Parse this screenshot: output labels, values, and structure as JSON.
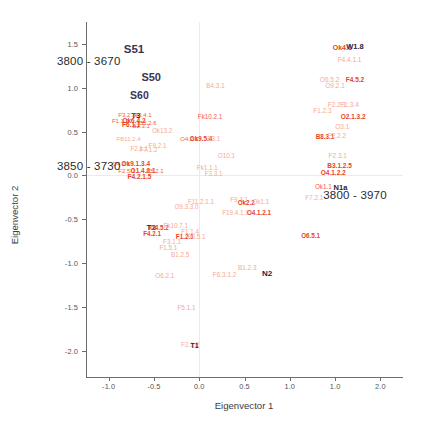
{
  "chart_data": {
    "type": "scatter",
    "title": "",
    "xlabel": "Eigenvector 1",
    "ylabel": "Eigenvector 2",
    "xlim": [
      -1.25,
      2.25
    ],
    "ylim": [
      -2.3,
      1.75
    ],
    "grid": false,
    "legend": null,
    "xticks": [
      "-1.0",
      "-0.5",
      "0.0",
      "0.5",
      "1.0",
      "1.0",
      "2.0"
    ],
    "xtick_values": [
      -1.0,
      -0.5,
      0.0,
      0.5,
      1.0,
      1.5,
      2.0
    ],
    "yticks": [
      "1.5",
      "1.0",
      "0.5",
      "0.0",
      "-0.5",
      "-1.0",
      "-1.5",
      "-2.0"
    ],
    "ytick_values": [
      1.5,
      1.0,
      0.5,
      0.0,
      -0.5,
      -1.0,
      -1.5,
      -2.0
    ],
    "annotations": [
      {
        "text": "3800 - 3670",
        "x": -1.22,
        "y": 1.3,
        "name": "annotation-cluster-left-top"
      },
      {
        "text": "3850 - 3730",
        "x": -1.22,
        "y": 0.11,
        "name": "annotation-cluster-left-bottom"
      },
      {
        "text": "3800 - 3970",
        "x": 1.72,
        "y": -0.22,
        "name": "annotation-cluster-right"
      }
    ],
    "points": [
      {
        "label": "S51",
        "x": -0.72,
        "y": 1.43,
        "style": "navy",
        "size": 11.5
      },
      {
        "label": "S50",
        "x": -0.53,
        "y": 1.12,
        "style": "navy",
        "size": 11
      },
      {
        "label": "S60",
        "x": -0.66,
        "y": 0.92,
        "style": "navy",
        "size": 10.5
      },
      {
        "label": "T3",
        "x": -0.7,
        "y": 0.68,
        "style": "dark",
        "size": 8
      },
      {
        "label": "F3.2.1",
        "x": -0.8,
        "y": 0.685,
        "style": "red",
        "size": 6
      },
      {
        "label": "F3.4.1",
        "x": -0.62,
        "y": 0.685,
        "style": "red",
        "size": 6
      },
      {
        "label": "F1.1.2",
        "x": -0.87,
        "y": 0.615,
        "style": "red",
        "size": 6
      },
      {
        "label": "Ok6.4.2",
        "x": -0.72,
        "y": 0.615,
        "style": "redd",
        "size": 6.5
      },
      {
        "label": "O5.2.6",
        "x": -0.57,
        "y": 0.6,
        "style": "red",
        "size": 6
      },
      {
        "label": "F6.1.1",
        "x": -0.75,
        "y": 0.575,
        "style": "redd",
        "size": 6.5
      },
      {
        "label": "B2.3.1",
        "x": -0.64,
        "y": 0.565,
        "style": "red",
        "size": 6
      },
      {
        "label": "Ok13.2",
        "x": -0.41,
        "y": 0.505,
        "style": "pale",
        "size": 6.3
      },
      {
        "label": "FB11.2.4",
        "x": -0.78,
        "y": 0.415,
        "style": "pale",
        "size": 6
      },
      {
        "label": "F9.2.1",
        "x": -0.46,
        "y": 0.335,
        "style": "pale",
        "size": 6.3
      },
      {
        "label": "F2.1.1",
        "x": -0.66,
        "y": 0.3,
        "style": "pale",
        "size": 6.3
      },
      {
        "label": "F7.1.2",
        "x": -0.56,
        "y": 0.295,
        "style": "pale",
        "size": 6.3
      },
      {
        "label": "O4.2.1",
        "x": -0.86,
        "y": 0.135,
        "style": "red",
        "size": 6
      },
      {
        "label": "Ok9.1.3.4",
        "x": -0.7,
        "y": 0.135,
        "style": "redd",
        "size": 6.5
      },
      {
        "label": "F2.5.1",
        "x": -0.8,
        "y": 0.055,
        "style": "red",
        "size": 6
      },
      {
        "label": "O1.4.2.1",
        "x": -0.62,
        "y": 0.055,
        "style": "redd",
        "size": 6.5
      },
      {
        "label": "B5.2.1",
        "x": -0.49,
        "y": 0.045,
        "style": "red",
        "size": 6
      },
      {
        "label": "F4.2.1.5",
        "x": -0.66,
        "y": -0.02,
        "style": "redd",
        "size": 6.5
      },
      {
        "label": "B4.3.1",
        "x": 0.18,
        "y": 1.02,
        "style": "pale",
        "size": 6.4
      },
      {
        "label": "Fk10.2.1",
        "x": 0.12,
        "y": 0.665,
        "style": "red",
        "size": 6.3
      },
      {
        "label": "O4.2.1",
        "x": -0.11,
        "y": 0.415,
        "style": "red",
        "size": 6
      },
      {
        "label": "Ok9.5.4",
        "x": 0.02,
        "y": 0.415,
        "style": "redd",
        "size": 6.3
      },
      {
        "label": "B3.1",
        "x": 0.16,
        "y": 0.415,
        "style": "pale",
        "size": 6.3
      },
      {
        "label": "O10.1",
        "x": 0.3,
        "y": 0.225,
        "style": "pale",
        "size": 6.4
      },
      {
        "label": "Fk1.1.1",
        "x": 0.09,
        "y": 0.085,
        "style": "pale",
        "size": 6.3
      },
      {
        "label": "F3.3.1",
        "x": 0.16,
        "y": 0.015,
        "style": "pale",
        "size": 6.3
      },
      {
        "label": "Ok4.1",
        "x": 1.58,
        "y": 1.47,
        "style": "redd",
        "size": 7
      },
      {
        "label": "W1.8",
        "x": 1.72,
        "y": 1.47,
        "style": "dark",
        "size": 7.5
      },
      {
        "label": "F4.4.1.1",
        "x": 1.66,
        "y": 1.315,
        "style": "pale",
        "size": 6.5
      },
      {
        "label": "O6.5.2",
        "x": 1.44,
        "y": 1.085,
        "style": "pale",
        "size": 6.5
      },
      {
        "label": "F4.5.2",
        "x": 1.72,
        "y": 1.085,
        "style": "redd",
        "size": 6.5
      },
      {
        "label": "O9.2.1",
        "x": 1.5,
        "y": 1.015,
        "style": "pale",
        "size": 6.5
      },
      {
        "label": "F2.2.1",
        "x": 1.52,
        "y": 0.805,
        "style": "pale",
        "size": 6.5
      },
      {
        "label": "F1.3.4",
        "x": 1.66,
        "y": 0.805,
        "style": "pale",
        "size": 6.5
      },
      {
        "label": "F1.2.3",
        "x": 1.36,
        "y": 0.735,
        "style": "pale",
        "size": 6.5
      },
      {
        "label": "O2.1.3.2",
        "x": 1.7,
        "y": 0.665,
        "style": "redd",
        "size": 6.5
      },
      {
        "label": "O3.1",
        "x": 1.58,
        "y": 0.555,
        "style": "pale",
        "size": 6.5
      },
      {
        "label": "B8.3.1",
        "x": 1.39,
        "y": 0.435,
        "style": "redd",
        "size": 6.3
      },
      {
        "label": "F2.2.2",
        "x": 1.52,
        "y": 0.455,
        "style": "pale",
        "size": 6.5
      },
      {
        "label": "F2.3.1",
        "x": 1.53,
        "y": 0.225,
        "style": "pale",
        "size": 6.5
      },
      {
        "label": "B3.1.2.5",
        "x": 1.55,
        "y": 0.105,
        "style": "redd",
        "size": 6.5
      },
      {
        "label": "O4.1.2.2",
        "x": 1.48,
        "y": 0.025,
        "style": "redd",
        "size": 6.5
      },
      {
        "label": "Ok1.1",
        "x": 1.37,
        "y": -0.135,
        "style": "red",
        "size": 6.3
      },
      {
        "label": "N1a",
        "x": 1.56,
        "y": -0.14,
        "style": "dark",
        "size": 7.5
      },
      {
        "label": "F7.2.1",
        "x": 1.27,
        "y": -0.255,
        "style": "pale",
        "size": 6.3
      },
      {
        "label": "T2",
        "x": -0.53,
        "y": -0.6,
        "style": "dark",
        "size": 8
      },
      {
        "label": "F11.2.1.1",
        "x": 0.02,
        "y": -0.3,
        "style": "pale",
        "size": 6.3
      },
      {
        "label": "O9.3.3.0",
        "x": -0.14,
        "y": -0.355,
        "style": "pale",
        "size": 6.3
      },
      {
        "label": "F9.3.1",
        "x": 0.44,
        "y": -0.285,
        "style": "pale",
        "size": 6.3
      },
      {
        "label": "Ok2.2",
        "x": 0.52,
        "y": -0.31,
        "style": "redd",
        "size": 6.3
      },
      {
        "label": "Ok1.1",
        "x": 0.68,
        "y": -0.305,
        "style": "pale",
        "size": 6.3
      },
      {
        "label": "F19.4.1.1",
        "x": 0.4,
        "y": -0.425,
        "style": "pale",
        "size": 6.3
      },
      {
        "label": "O4.1.2.1",
        "x": 0.66,
        "y": -0.43,
        "style": "redd",
        "size": 6.3
      },
      {
        "label": "O4.5.2",
        "x": -0.44,
        "y": -0.6,
        "style": "redd",
        "size": 6.3
      },
      {
        "label": "F4.2.1",
        "x": -0.52,
        "y": -0.665,
        "style": "redd",
        "size": 6.3
      },
      {
        "label": "Fk10.7.1",
        "x": -0.26,
        "y": -0.575,
        "style": "pale",
        "size": 6.3
      },
      {
        "label": "F1.1.4",
        "x": -0.1,
        "y": -0.645,
        "style": "pale",
        "size": 6.3
      },
      {
        "label": "F1.2.1",
        "x": -0.16,
        "y": -0.705,
        "style": "redd",
        "size": 6.3
      },
      {
        "label": "B3.5.1",
        "x": -0.03,
        "y": -0.705,
        "style": "pale",
        "size": 6.3
      },
      {
        "label": "F3.1.1",
        "x": -0.3,
        "y": -0.755,
        "style": "pale",
        "size": 6.3
      },
      {
        "label": "F1.5.1",
        "x": -0.34,
        "y": -0.825,
        "style": "pale",
        "size": 6.3
      },
      {
        "label": "B1.2.5",
        "x": -0.21,
        "y": -0.905,
        "style": "pale",
        "size": 6.3
      },
      {
        "label": "O6.5.1",
        "x": 1.23,
        "y": -0.69,
        "style": "redd",
        "size": 6.3
      },
      {
        "label": "B1.2.3",
        "x": 0.53,
        "y": -1.06,
        "style": "pale",
        "size": 6.4
      },
      {
        "label": "N2",
        "x": 0.75,
        "y": -1.13,
        "style": "dark",
        "size": 8
      },
      {
        "label": "F6.3.1.2",
        "x": 0.28,
        "y": -1.14,
        "style": "pale",
        "size": 6.4
      },
      {
        "label": "O6.2.1",
        "x": -0.38,
        "y": -1.15,
        "style": "pale",
        "size": 6.4
      },
      {
        "label": "F5.1.1",
        "x": -0.14,
        "y": -1.51,
        "style": "pale",
        "size": 6.4
      },
      {
        "label": "F2.1.2",
        "x": -0.1,
        "y": -1.93,
        "style": "pale",
        "size": 6.4
      },
      {
        "label": "T1",
        "x": -0.05,
        "y": -1.93,
        "style": "dark",
        "size": 7
      }
    ]
  },
  "caption": ""
}
